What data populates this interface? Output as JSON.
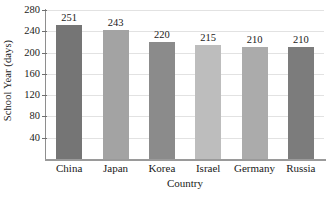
{
  "chart_data": {
    "type": "bar",
    "title": "",
    "xlabel": "Country",
    "ylabel": "School Year (days)",
    "categories": [
      "China",
      "Japan",
      "Korea",
      "Israel",
      "Germany",
      "Russia"
    ],
    "values": [
      251,
      243,
      220,
      215,
      210,
      210
    ],
    "value_labels": [
      "251",
      "243",
      "220",
      "215",
      "210",
      "210"
    ],
    "bar_colors": [
      "#757575",
      "#a3a3a3",
      "#8b8b8b",
      "#bdbdbd",
      "#ababab",
      "#7c7c7c"
    ],
    "ylim": [
      0,
      280
    ],
    "yticks": [
      40,
      80,
      120,
      160,
      200,
      240,
      280
    ],
    "ytick_labels": [
      "40",
      "80",
      "120",
      "160",
      "200",
      "240",
      "280"
    ],
    "grid": "horizontal",
    "grid_color": "#e2e2e2",
    "legend": "none",
    "axis_color": "#9a9a9a",
    "text_color": "#1a1a1a"
  }
}
